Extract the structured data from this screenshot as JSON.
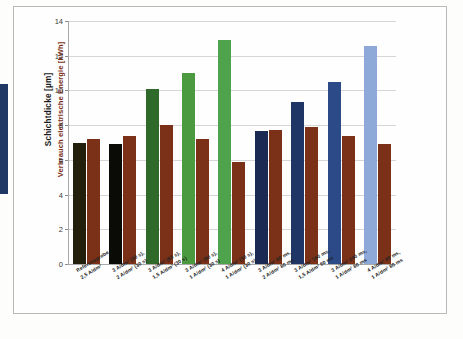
{
  "accent": {
    "color": "#1f3864"
  },
  "chart_data": {
    "type": "bar",
    "title": "",
    "xlabel": "",
    "ylabel": "Schichtdicke [µm] / Verbrauch elektrische Energie [kWh]",
    "ylabel_lines": [
      "Schichtdicke [µm]",
      "Verbrauch elektrische Energie [kWh]"
    ],
    "ylim": [
      0,
      14
    ],
    "yticks": [
      0,
      2,
      4,
      6,
      8,
      10,
      12,
      14
    ],
    "ytick_labels": [
      "0",
      "2",
      "4",
      "6",
      "8",
      "10",
      "12",
      "14"
    ],
    "grid": true,
    "legend": "none",
    "categories": [
      {
        "line1": "Referenzprobe",
        "line2": "2,5 A/dm²"
      },
      {
        "line1": "3 A/dm² (30 s),",
        "line2": "2 A/dm² (30 s)"
      },
      {
        "line1": "3 A/dm² (60 s),",
        "line2": "1,5 A/dm² (30 s)"
      },
      {
        "line1": "3 A/dm² (90 s),",
        "line2": "1 A/dm² (30 s)"
      },
      {
        "line1": "4 A/dm² (30 s),",
        "line2": "1 A/dm² (30 s)"
      },
      {
        "line1": "3 A/dm² 80 ms,",
        "line2": "2 A/dm² 80 ms"
      },
      {
        "line1": "3 A/dm² 160 ms,",
        "line2": "1,5 A/dm² 80 ms"
      },
      {
        "line1": "3 A/dm² 240 ms,",
        "line2": "1 A/dm² 80 ms"
      },
      {
        "line1": "4 A/dm² 80 ms,",
        "line2": "1 A/dm² 80 ms"
      }
    ],
    "series": [
      {
        "name": "Schichtdicke [µm]",
        "values": [
          6.95,
          6.9,
          10.1,
          11.0,
          12.9,
          7.65,
          9.35,
          10.5,
          12.55
        ],
        "colors": [
          "#22200d",
          "#0a0a06",
          "#2f6a2a",
          "#4c9a3f",
          "#4ea34c",
          "#1b2a52",
          "#1f3565",
          "#2c4a87",
          "#8ea9d8"
        ]
      },
      {
        "name": "Verbrauch elektrische Energie [kWh]",
        "values": [
          7.2,
          7.4,
          8.0,
          7.2,
          5.9,
          7.7,
          7.9,
          7.4,
          6.9
        ],
        "colors": [
          "#7b3118",
          "#7b3118",
          "#7b3118",
          "#7b3118",
          "#7b3118",
          "#7b3118",
          "#7b3118",
          "#7b3118",
          "#7b3118"
        ]
      }
    ]
  }
}
